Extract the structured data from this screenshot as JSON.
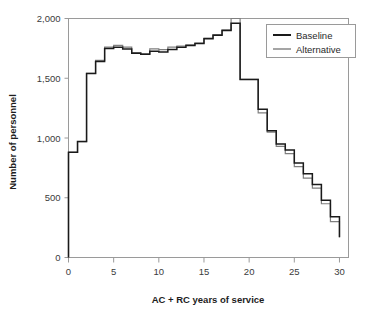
{
  "chart_data": {
    "type": "line",
    "subtype": "step",
    "title": "",
    "xlabel": "AC + RC years of service",
    "ylabel": "Number of personnel",
    "xlim": [
      0,
      31
    ],
    "ylim": [
      0,
      2000
    ],
    "xticks": [
      0,
      5,
      10,
      15,
      20,
      25,
      30
    ],
    "xtick_labels": [
      "0",
      "5",
      "10",
      "15",
      "20",
      "25",
      "30"
    ],
    "yticks": [
      0,
      500,
      1000,
      1500,
      2000
    ],
    "ytick_labels": [
      "0",
      "500",
      "1,000",
      "1,500",
      "2,000"
    ],
    "grid": false,
    "legend_position": "top-right",
    "x": [
      1,
      2,
      3,
      4,
      5,
      6,
      7,
      8,
      9,
      10,
      11,
      12,
      13,
      14,
      15,
      16,
      17,
      18,
      19,
      20,
      21,
      22,
      23,
      24,
      25,
      26,
      27,
      28,
      29,
      30
    ],
    "series": [
      {
        "name": "Baseline",
        "color": "#1a1a1a",
        "values": [
          880,
          970,
          1540,
          1640,
          1750,
          1760,
          1745,
          1710,
          1700,
          1725,
          1720,
          1740,
          1760,
          1775,
          1790,
          1830,
          1860,
          1900,
          1960,
          1490,
          1490,
          1240,
          1060,
          950,
          900,
          790,
          700,
          610,
          480,
          340
        ]
      },
      {
        "name": "Alternative",
        "color": "#7f7f7f",
        "values": [
          880,
          970,
          1540,
          1650,
          1760,
          1775,
          1760,
          1715,
          1705,
          1745,
          1740,
          1760,
          1770,
          1780,
          1795,
          1835,
          1865,
          1905,
          2000,
          1490,
          1490,
          1210,
          1050,
          930,
          870,
          760,
          665,
          580,
          450,
          300
        ]
      }
    ],
    "end_drop_value": 170
  },
  "legend": {
    "entries": [
      {
        "label": "Baseline"
      },
      {
        "label": "Alternative"
      }
    ]
  },
  "colors": {
    "baseline": "#1a1a1a",
    "alternative": "#7f7f7f",
    "frame": "#9a9a9a",
    "text": "#3b3b3b"
  }
}
